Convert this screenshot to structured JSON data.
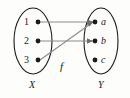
{
  "figure": {
    "function_label": "f",
    "domain": {
      "name": "X",
      "elements": [
        {
          "label": "1",
          "x": 32,
          "y": 22
        },
        {
          "label": "2",
          "x": 32,
          "y": 41
        },
        {
          "label": "3",
          "x": 32,
          "y": 60
        }
      ],
      "oval": {
        "cx": 33,
        "cy": 41,
        "rx": 19,
        "ry": 33
      },
      "label_pos": {
        "x": 30,
        "y": 85
      }
    },
    "codomain": {
      "name": "Y",
      "elements": [
        {
          "label": "a",
          "x": 100,
          "y": 22
        },
        {
          "label": "b",
          "x": 100,
          "y": 41
        },
        {
          "label": "c",
          "x": 100,
          "y": 60
        }
      ],
      "oval": {
        "cx": 101,
        "cy": 41,
        "rx": 17,
        "ry": 33
      },
      "label_pos": {
        "x": 99,
        "y": 85
      }
    },
    "function_label_pos": {
      "x": 62,
      "y": 66
    },
    "arrows": [
      {
        "from": "1",
        "to": "a",
        "kind": "horizontal"
      },
      {
        "from": "2",
        "to": "b",
        "kind": "horizontal"
      },
      {
        "from": "3",
        "to": "a",
        "kind": "diagonal"
      }
    ],
    "colors": {
      "oval_stroke": "#1a1a1a",
      "arrow_stroke": "#8c8c8c",
      "dot_fill": "#1a1a1a",
      "text": "#1a1a1a",
      "background": "#fdfdfc"
    }
  }
}
